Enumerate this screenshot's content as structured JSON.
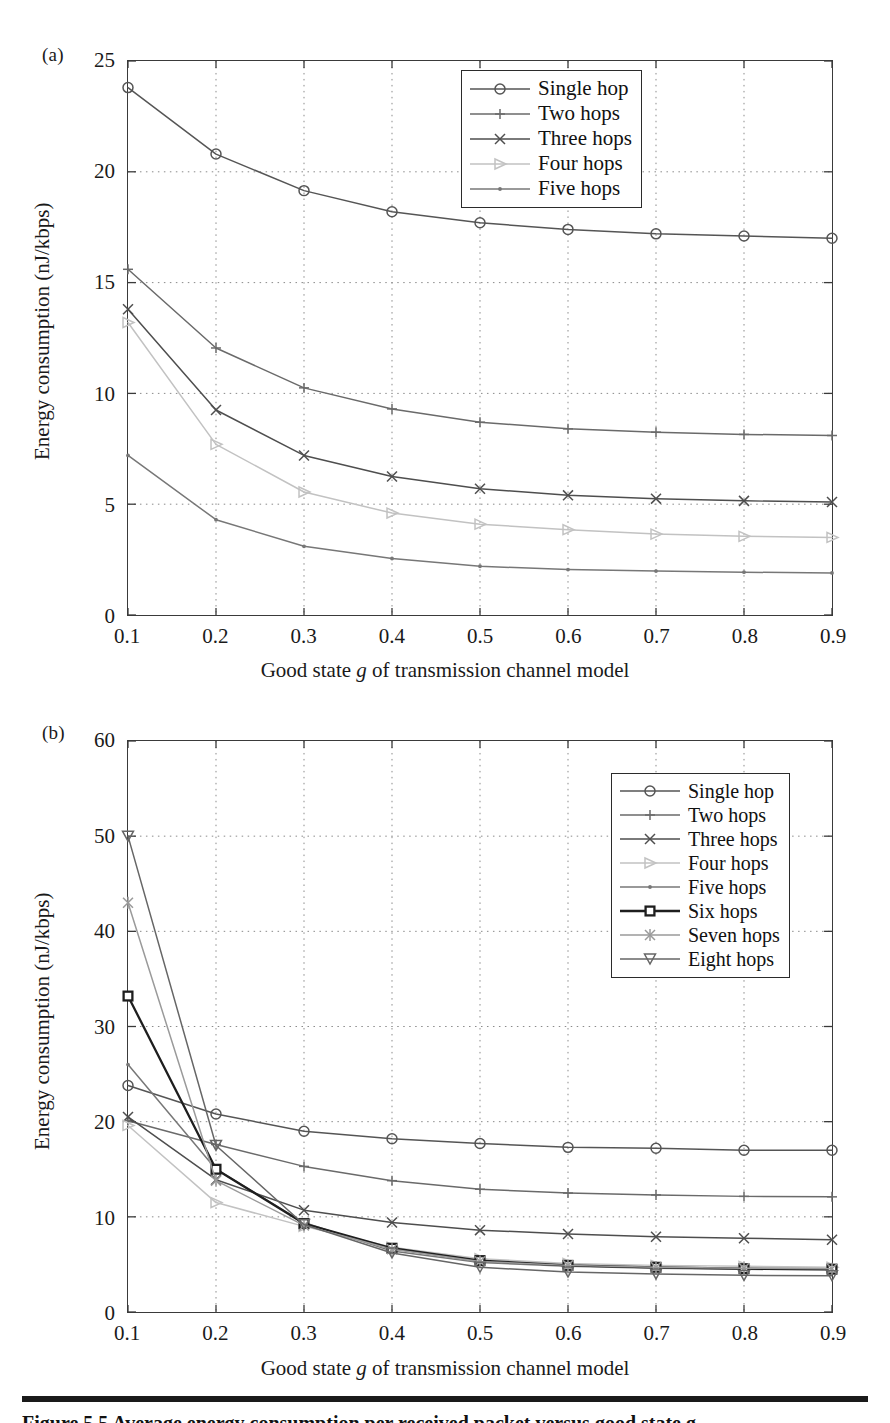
{
  "figure": {
    "caption": "Figure 5.5   Average energy consumption per received packet versus good state g.",
    "panel_a_label": "(a)",
    "panel_b_label": "(b)"
  },
  "axis": {
    "xlabel_prefix": "Good state ",
    "xlabel_italic": "g",
    "xlabel_suffix": " of transmission channel model",
    "ylabel": "Energy consumption (nJ/kbps)"
  },
  "colors": {
    "single_hop": "#555555",
    "two_hops": "#6a6a6a",
    "three_hops": "#4e4e4e",
    "four_hops": "#c2c2c2",
    "five_hops": "#777777",
    "six_hops": "#1e1e1e",
    "seven_hops": "#9a9a9a",
    "eight_hops": "#666666",
    "frame": "#3a3a3a",
    "grid": "#8a8a8a"
  },
  "chart_data": [
    {
      "type": "line",
      "panel": "(a)",
      "title": "",
      "xlabel": "Good state g of transmission channel model",
      "ylabel": "Energy consumption (nJ/kbps)",
      "x": [
        0.1,
        0.2,
        0.3,
        0.4,
        0.5,
        0.6,
        0.7,
        0.8,
        0.9
      ],
      "xticklabels": [
        "0.1",
        "0.2",
        "0.3",
        "0.4",
        "0.5",
        "0.6",
        "0.7",
        "0.8",
        "0.9"
      ],
      "yticklabels": [
        "0",
        "5",
        "10",
        "15",
        "20",
        "25"
      ],
      "yticks": [
        0,
        5,
        10,
        15,
        20,
        25
      ],
      "xlim": [
        0.1,
        0.9
      ],
      "ylim": [
        0,
        25
      ],
      "grid": true,
      "legend_position": "upper right",
      "series": [
        {
          "name": "Single hop",
          "marker": "circle",
          "color": "#555555",
          "values": [
            23.8,
            20.8,
            19.15,
            18.2,
            17.7,
            17.4,
            17.2,
            17.1,
            17.0
          ]
        },
        {
          "name": "Two hops",
          "marker": "plus",
          "color": "#6a6a6a",
          "values": [
            15.6,
            12.05,
            10.25,
            9.3,
            8.7,
            8.4,
            8.25,
            8.15,
            8.1
          ]
        },
        {
          "name": "Three hops",
          "marker": "cross",
          "color": "#4e4e4e",
          "values": [
            13.8,
            9.25,
            7.2,
            6.25,
            5.7,
            5.4,
            5.25,
            5.15,
            5.1
          ]
        },
        {
          "name": "Four hops",
          "marker": "triangle-right",
          "color": "#c2c2c2",
          "values": [
            13.2,
            7.7,
            5.55,
            4.6,
            4.1,
            3.85,
            3.65,
            3.55,
            3.5
          ]
        },
        {
          "name": "Five hops",
          "marker": "dot",
          "color": "#777777",
          "values": [
            7.2,
            4.3,
            3.1,
            2.55,
            2.2,
            2.05,
            1.98,
            1.93,
            1.9
          ]
        }
      ]
    },
    {
      "type": "line",
      "panel": "(b)",
      "title": "",
      "xlabel": "Good state g of transmission channel model",
      "ylabel": "Energy consumption (nJ/kbps)",
      "x": [
        0.1,
        0.2,
        0.3,
        0.4,
        0.5,
        0.6,
        0.7,
        0.8,
        0.9
      ],
      "xticklabels": [
        "0.1",
        "0.2",
        "0.3",
        "0.4",
        "0.5",
        "0.6",
        "0.7",
        "0.8",
        "0.9"
      ],
      "yticklabels": [
        "0",
        "10",
        "20",
        "30",
        "40",
        "50",
        "60"
      ],
      "yticks": [
        0,
        10,
        20,
        30,
        40,
        50,
        60
      ],
      "xlim": [
        0.1,
        0.9
      ],
      "ylim": [
        0,
        60
      ],
      "grid": true,
      "legend_position": "upper right",
      "series": [
        {
          "name": "Single hop",
          "marker": "circle",
          "color": "#555555",
          "values": [
            23.8,
            20.8,
            19.0,
            18.2,
            17.7,
            17.3,
            17.2,
            17.0,
            17.0
          ]
        },
        {
          "name": "Two hops",
          "marker": "plus",
          "color": "#6a6a6a",
          "values": [
            20.1,
            17.6,
            15.3,
            13.8,
            12.9,
            12.5,
            12.3,
            12.15,
            12.1
          ]
        },
        {
          "name": "Three hops",
          "marker": "cross",
          "color": "#4e4e4e",
          "values": [
            20.5,
            13.9,
            10.7,
            9.4,
            8.6,
            8.2,
            7.9,
            7.75,
            7.6
          ]
        },
        {
          "name": "Four hops",
          "marker": "triangle-right",
          "color": "#c2c2c2",
          "values": [
            19.6,
            11.5,
            9.0,
            6.8,
            5.6,
            5.1,
            4.9,
            4.8,
            4.7
          ]
        },
        {
          "name": "Five hops",
          "marker": "dot",
          "color": "#777777",
          "values": [
            26.0,
            15.0,
            9.4,
            6.4,
            5.2,
            4.8,
            4.6,
            4.5,
            4.4
          ]
        },
        {
          "name": "Six hops",
          "marker": "square",
          "color": "#1e1e1e",
          "values": [
            33.2,
            15.0,
            9.3,
            6.7,
            5.4,
            4.9,
            4.7,
            4.55,
            4.5
          ]
        },
        {
          "name": "Seven hops",
          "marker": "asterisk",
          "color": "#9a9a9a",
          "values": [
            43.0,
            13.8,
            9.1,
            6.6,
            5.3,
            4.9,
            4.7,
            4.6,
            4.55
          ]
        },
        {
          "name": "Eight hops",
          "marker": "triangle-down",
          "color": "#666666",
          "values": [
            50.0,
            17.5,
            9.2,
            6.2,
            4.7,
            4.2,
            4.0,
            3.85,
            3.8
          ]
        }
      ]
    }
  ]
}
